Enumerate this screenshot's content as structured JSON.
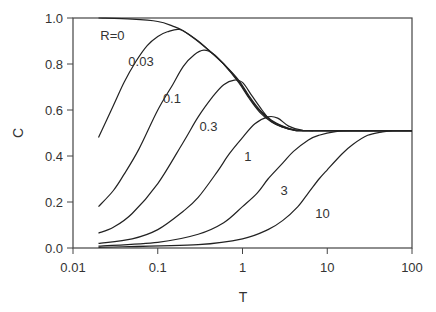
{
  "chart_data": {
    "type": "line",
    "title": "",
    "xlabel": "T",
    "ylabel": "C",
    "xscale": "log",
    "xlim": [
      0.01,
      100
    ],
    "ylim": [
      0.0,
      1.0
    ],
    "grid": false,
    "legend": "inline curve labels",
    "x_ticks": [
      {
        "value": 0.01,
        "label": "0.01"
      },
      {
        "value": 0.1,
        "label": "0.1"
      },
      {
        "value": 1,
        "label": "1"
      },
      {
        "value": 10,
        "label": "10"
      },
      {
        "value": 100,
        "label": "100"
      }
    ],
    "y_ticks": [
      {
        "value": 0.0,
        "label": "0.0"
      },
      {
        "value": 0.2,
        "label": "0.2"
      },
      {
        "value": 0.4,
        "label": "0.4"
      },
      {
        "value": 0.6,
        "label": "0.6"
      },
      {
        "value": 0.8,
        "label": "0.8"
      },
      {
        "value": 1.0,
        "label": "1.0"
      }
    ],
    "series": [
      {
        "name": "R=0",
        "label": "R=0",
        "label_pos": [
          0.021,
          0.905
        ],
        "points": [
          [
            0.02,
            1.0
          ],
          [
            0.05,
            0.995
          ],
          [
            0.1,
            0.985
          ],
          [
            0.15,
            0.965
          ],
          [
            0.2,
            0.945
          ],
          [
            0.3,
            0.9
          ],
          [
            0.4,
            0.86
          ],
          [
            0.6,
            0.8
          ],
          [
            0.9,
            0.73
          ],
          [
            1.2,
            0.66
          ],
          [
            1.6,
            0.6
          ],
          [
            2.2,
            0.555
          ],
          [
            3,
            0.53
          ],
          [
            4,
            0.515
          ],
          [
            6,
            0.51
          ],
          [
            10,
            0.51
          ],
          [
            100,
            0.51
          ]
        ]
      },
      {
        "name": "R=0.03",
        "label": "0.03",
        "label_pos": [
          0.045,
          0.79
        ],
        "points": [
          [
            0.02,
            0.48
          ],
          [
            0.03,
            0.62
          ],
          [
            0.04,
            0.72
          ],
          [
            0.055,
            0.81
          ],
          [
            0.075,
            0.88
          ],
          [
            0.1,
            0.92
          ],
          [
            0.13,
            0.94
          ],
          [
            0.18,
            0.95
          ],
          [
            0.25,
            0.92
          ],
          [
            0.4,
            0.86
          ],
          [
            0.6,
            0.8
          ],
          [
            0.9,
            0.725
          ],
          [
            1.2,
            0.655
          ],
          [
            1.6,
            0.595
          ],
          [
            2.2,
            0.552
          ],
          [
            3,
            0.528
          ],
          [
            4,
            0.514
          ],
          [
            6,
            0.51
          ],
          [
            100,
            0.51
          ]
        ]
      },
      {
        "name": "R=0.1",
        "label": "0.1",
        "label_pos": [
          0.115,
          0.63
        ],
        "points": [
          [
            0.02,
            0.18
          ],
          [
            0.03,
            0.25
          ],
          [
            0.04,
            0.32
          ],
          [
            0.06,
            0.43
          ],
          [
            0.1,
            0.6
          ],
          [
            0.15,
            0.71
          ],
          [
            0.2,
            0.79
          ],
          [
            0.27,
            0.84
          ],
          [
            0.35,
            0.86
          ],
          [
            0.45,
            0.845
          ],
          [
            0.6,
            0.8
          ],
          [
            0.9,
            0.72
          ],
          [
            1.2,
            0.65
          ],
          [
            1.6,
            0.59
          ],
          [
            2.2,
            0.548
          ],
          [
            3,
            0.525
          ],
          [
            4,
            0.513
          ],
          [
            6,
            0.51
          ],
          [
            100,
            0.51
          ]
        ]
      },
      {
        "name": "R=0.3",
        "label": "0.3",
        "label_pos": [
          0.31,
          0.51
        ],
        "points": [
          [
            0.02,
            0.065
          ],
          [
            0.03,
            0.09
          ],
          [
            0.05,
            0.15
          ],
          [
            0.1,
            0.28
          ],
          [
            0.2,
            0.46
          ],
          [
            0.3,
            0.57
          ],
          [
            0.45,
            0.66
          ],
          [
            0.6,
            0.71
          ],
          [
            0.8,
            0.73
          ],
          [
            1.0,
            0.72
          ],
          [
            1.3,
            0.66
          ],
          [
            1.7,
            0.6
          ],
          [
            2.2,
            0.55
          ],
          [
            3,
            0.525
          ],
          [
            4,
            0.512
          ],
          [
            6,
            0.51
          ],
          [
            100,
            0.51
          ]
        ]
      },
      {
        "name": "R=1",
        "label": "1",
        "label_pos": [
          1.05,
          0.38
        ],
        "points": [
          [
            0.02,
            0.02
          ],
          [
            0.05,
            0.04
          ],
          [
            0.1,
            0.08
          ],
          [
            0.2,
            0.16
          ],
          [
            0.3,
            0.22
          ],
          [
            0.5,
            0.33
          ],
          [
            0.7,
            0.41
          ],
          [
            1.0,
            0.48
          ],
          [
            1.4,
            0.54
          ],
          [
            2.0,
            0.57
          ],
          [
            2.6,
            0.565
          ],
          [
            3.5,
            0.53
          ],
          [
            5,
            0.512
          ],
          [
            7,
            0.51
          ],
          [
            100,
            0.51
          ]
        ]
      },
      {
        "name": "R=3",
        "label": "3",
        "label_pos": [
          2.8,
          0.23
        ],
        "points": [
          [
            0.02,
            0.008
          ],
          [
            0.1,
            0.025
          ],
          [
            0.3,
            0.06
          ],
          [
            0.6,
            0.11
          ],
          [
            1.0,
            0.18
          ],
          [
            1.5,
            0.24
          ],
          [
            2.0,
            0.3
          ],
          [
            3.0,
            0.37
          ],
          [
            4.0,
            0.42
          ],
          [
            6.0,
            0.47
          ],
          [
            8.0,
            0.49
          ],
          [
            12,
            0.505
          ],
          [
            20,
            0.51
          ],
          [
            100,
            0.51
          ]
        ]
      },
      {
        "name": "R=10",
        "label": "10",
        "label_pos": [
          7.2,
          0.13
        ],
        "points": [
          [
            0.02,
            0.003
          ],
          [
            0.3,
            0.015
          ],
          [
            1.0,
            0.04
          ],
          [
            2.0,
            0.08
          ],
          [
            3.0,
            0.12
          ],
          [
            4.5,
            0.18
          ],
          [
            6.0,
            0.24
          ],
          [
            8.0,
            0.3
          ],
          [
            10,
            0.34
          ],
          [
            15,
            0.41
          ],
          [
            20,
            0.45
          ],
          [
            30,
            0.49
          ],
          [
            45,
            0.505
          ],
          [
            60,
            0.51
          ],
          [
            100,
            0.51
          ]
        ]
      }
    ]
  },
  "style": {
    "line_color": "#222222",
    "axis_color": "#444444",
    "text_color": "#333333",
    "background": "#ffffff"
  },
  "layout": {
    "plot_left": 73,
    "plot_right": 412,
    "plot_top": 18,
    "plot_bottom": 248
  }
}
